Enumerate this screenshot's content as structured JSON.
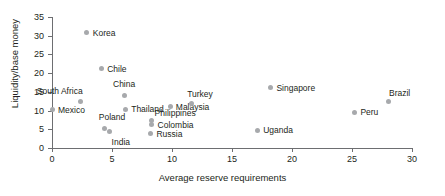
{
  "chart_data": {
    "type": "scatter",
    "title": "",
    "xlabel": "Average reserve requirements",
    "ylabel": "Liquidity/base money",
    "xlim": [
      0,
      30
    ],
    "ylim": [
      0,
      35
    ],
    "xticks": [
      0,
      5,
      10,
      15,
      20,
      25,
      30
    ],
    "yticks": [
      0,
      5,
      10,
      15,
      20,
      25,
      30,
      35
    ],
    "grid": false,
    "legend": "none",
    "marker_color": "#a7a9ac",
    "axis_color": "#6d6e71",
    "points": [
      {
        "label": "Mexico",
        "x": 0.0,
        "y": 10.2,
        "label_dx": 6,
        "label_dy": -4
      },
      {
        "label": "South Africa",
        "x": 2.4,
        "y": 12.3,
        "label_dx": -44,
        "label_dy": -15
      },
      {
        "label": "Korea",
        "x": 2.9,
        "y": 30.8,
        "label_dx": 6,
        "label_dy": -4
      },
      {
        "label": "Chile",
        "x": 4.1,
        "y": 21.2,
        "label_dx": 6,
        "label_dy": -4
      },
      {
        "label": "Poland",
        "x": 4.4,
        "y": 5.3,
        "label_dx": -6,
        "label_dy": -15
      },
      {
        "label": "India",
        "x": 4.8,
        "y": 4.4,
        "label_dx": 2,
        "label_dy": 6
      },
      {
        "label": "China",
        "x": 6.0,
        "y": 13.9,
        "label_dx": -11,
        "label_dy": -16
      },
      {
        "label": "Thailand",
        "x": 6.1,
        "y": 10.4,
        "label_dx": 6,
        "label_dy": -4
      },
      {
        "label": "Philippines",
        "x": 8.3,
        "y": 7.4,
        "label_dx": 3,
        "label_dy": -11
      },
      {
        "label": "Colombia",
        "x": 8.3,
        "y": 6.4,
        "label_dx": 6,
        "label_dy": -3
      },
      {
        "label": "Russia",
        "x": 8.2,
        "y": 3.8,
        "label_dx": 6,
        "label_dy": -4
      },
      {
        "label": "Malaysia",
        "x": 9.9,
        "y": 11.1,
        "label_dx": 5,
        "label_dy": -3
      },
      {
        "label": "Turkey",
        "x": 11.6,
        "y": 12.0,
        "label_dx": -4,
        "label_dy": -13
      },
      {
        "label": "Uganda",
        "x": 17.1,
        "y": 4.8,
        "label_dx": 6,
        "label_dy": -4
      },
      {
        "label": "Singapore",
        "x": 18.2,
        "y": 16.1,
        "label_dx": 6,
        "label_dy": -4
      },
      {
        "label": "Peru",
        "x": 25.2,
        "y": 9.6,
        "label_dx": 6,
        "label_dy": -4
      },
      {
        "label": "Brazil",
        "x": 28.0,
        "y": 12.3,
        "label_dx": 1,
        "label_dy": -13
      }
    ]
  }
}
